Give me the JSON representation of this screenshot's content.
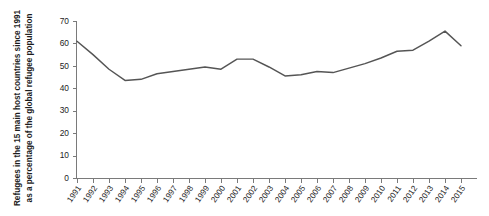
{
  "chart_data": {
    "type": "line",
    "title": "",
    "xlabel": "",
    "ylabel": "Refugees in the 15 main host countries since 1991 as a percentage of the global refugee population",
    "ylim": [
      0,
      70
    ],
    "yticks": [
      0,
      10,
      20,
      30,
      40,
      50,
      60,
      70
    ],
    "ytick_labels": [
      "0",
      "10",
      "20",
      "30",
      "40",
      "50",
      "60",
      "70"
    ],
    "grid": false,
    "legend": "none",
    "line_color": "#555555",
    "axis_color": "#7a7a7a",
    "categories": [
      "1991",
      "1992",
      "1993",
      "1994",
      "1995",
      "1996",
      "1997",
      "1998",
      "1999",
      "2000",
      "2001",
      "2002",
      "2003",
      "2004",
      "2005",
      "2006",
      "2007",
      "2008",
      "2009",
      "2010",
      "2011",
      "2012",
      "2013",
      "2014",
      "2015"
    ],
    "values": [
      61.0,
      55.0,
      48.5,
      43.5,
      44.0,
      46.5,
      47.5,
      48.5,
      49.5,
      48.5,
      53.0,
      53.0,
      49.5,
      45.5,
      46.0,
      47.5,
      47.0,
      49.0,
      51.0,
      53.5,
      56.5,
      57.0,
      61.0,
      65.5,
      59.0
    ],
    "series": [
      {
        "name": "Refugees in 15 main host countries (% of global refugee population)",
        "values": [
          61.0,
          55.0,
          48.5,
          43.5,
          44.0,
          46.5,
          47.5,
          48.5,
          49.5,
          48.5,
          53.0,
          53.0,
          49.5,
          45.5,
          46.0,
          47.5,
          47.0,
          49.0,
          51.0,
          53.5,
          56.5,
          57.0,
          61.0,
          65.5,
          59.0
        ]
      }
    ]
  }
}
